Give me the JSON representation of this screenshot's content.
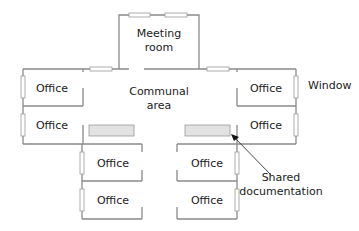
{
  "diagram": {
    "type": "floor-plan",
    "rooms": {
      "meeting_room": [
        "Meeting",
        "room"
      ],
      "communal_area": [
        "Communal",
        "area"
      ],
      "office_left_upper": "Office",
      "office_left_lower": "Office",
      "office_right_upper": "Office",
      "office_right_lower": "Office",
      "office_bottom_left_upper": "Office",
      "office_bottom_left_lower": "Office",
      "office_bottom_right_upper": "Office",
      "office_bottom_right_lower": "Office"
    },
    "annotations": {
      "window": "Window",
      "shared_documentation": [
        "Shared",
        "documentation"
      ]
    },
    "colors": {
      "wall": "#8a8a8a",
      "shared_doc_fill": "#e2e2e2",
      "arrow": "#333333",
      "text": "#1a1a1a"
    }
  }
}
